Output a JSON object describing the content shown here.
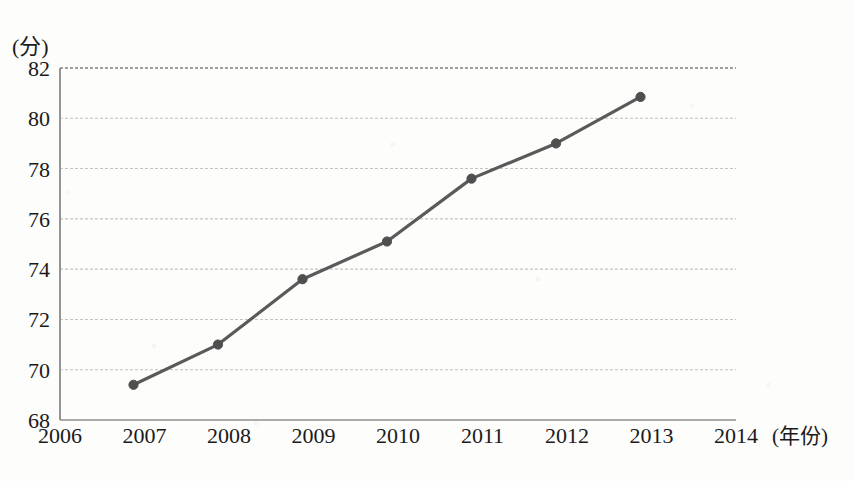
{
  "chart_data": {
    "type": "line",
    "title": "",
    "subtitle": "",
    "xlabel": "(年份)",
    "ylabel": "(分)",
    "x": [
      2007,
      2008,
      2009,
      2010,
      2011,
      2012,
      2013
    ],
    "categories": [
      "2007",
      "2008",
      "2009",
      "2010",
      "2011",
      "2012",
      "2013"
    ],
    "values": [
      69.4,
      71.0,
      73.6,
      75.1,
      77.6,
      79.0,
      80.85
    ],
    "series": [
      {
        "name": "score",
        "values": [
          69.4,
          71.0,
          73.6,
          75.1,
          77.6,
          79.0,
          80.85
        ]
      }
    ],
    "x_tick_labels": [
      "2006",
      "2007",
      "2008",
      "2009",
      "2010",
      "2011",
      "2012",
      "2013",
      "2014"
    ],
    "y_tick_labels": [
      "68",
      "70",
      "72",
      "74",
      "76",
      "78",
      "80",
      "82"
    ],
    "xlim": [
      2006,
      2014
    ],
    "ylim": [
      68,
      82
    ],
    "y_tick_step": 2,
    "grid": true,
    "grid_axis": "y",
    "legend": false,
    "legend_position": "none",
    "marker": "circle",
    "line_color": "#5a5a5a",
    "marker_color": "#4f4f4f",
    "grid_color": "#b9b9b9",
    "axis_color": "#8a8a8a",
    "text_color": "#1a1a1a",
    "background_color": "#fdfdfc"
  },
  "axis": {
    "y_unit": "(分)",
    "x_unit": "(年份)"
  },
  "geometry": {
    "plot_left": 60,
    "plot_right": 736,
    "plot_top": 68,
    "plot_bottom": 420,
    "x_label_row_y": 443,
    "point_x_offset": -11
  }
}
